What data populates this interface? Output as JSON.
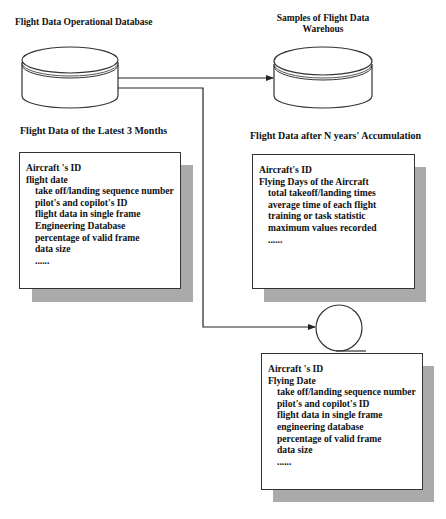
{
  "nodes": {
    "operational_db": {
      "label": "Flight Data Operational Database",
      "icon": "database-cylinder-icon"
    },
    "warehouse_samples": {
      "label_line1": "Samples of Flight Data",
      "label_line2": "Warehous",
      "icon": "database-cylinder-icon"
    },
    "circle_node": {
      "icon": "circle-node-icon"
    }
  },
  "panels": {
    "latest_3_months": {
      "heading": "Flight Data of the Latest 3 Months",
      "items": [
        {
          "text": "Aircraft 's ID",
          "indent": false
        },
        {
          "text": "flight date",
          "indent": false
        },
        {
          "text": "take off/landing sequence number",
          "indent": true
        },
        {
          "text": "pilot's and copilot's ID",
          "indent": true
        },
        {
          "text": "flight data in single frame",
          "indent": true
        },
        {
          "text": "Engineering Database",
          "indent": true
        },
        {
          "text": "percentage of valid frame",
          "indent": true
        },
        {
          "text": "data size",
          "indent": true
        },
        {
          "text": "......",
          "indent": true
        }
      ]
    },
    "n_years_accumulation": {
      "heading": "Flight Data after N years' Accumulation",
      "items": [
        {
          "text": "Aircraft's ID",
          "indent": false
        },
        {
          "text": "Flying Days of the Aircraft",
          "indent": false
        },
        {
          "text": "total takeoff/landing times",
          "indent": true
        },
        {
          "text": "average time of each flight",
          "indent": true
        },
        {
          "text": "training or task statistic",
          "indent": true
        },
        {
          "text": "maximum values recorded",
          "indent": true
        },
        {
          "text": "......",
          "indent": true
        }
      ]
    },
    "sample_record": {
      "items": [
        {
          "text": "Aircraft 's ID",
          "indent": false
        },
        {
          "text": "Flying Date",
          "indent": false
        },
        {
          "text": "take off/landing sequence number",
          "indent": true
        },
        {
          "text": "pilot's and copilot's ID",
          "indent": true
        },
        {
          "text": "flight data in single frame",
          "indent": true
        },
        {
          "text": "engineering database",
          "indent": true
        },
        {
          "text": "percentage of valid frame",
          "indent": true
        },
        {
          "text": "data size",
          "indent": true
        },
        {
          "text": "......",
          "indent": true
        }
      ]
    }
  },
  "colors": {
    "stroke": "#333333",
    "shadow": "#aaaaaa",
    "background": "#ffffff"
  }
}
